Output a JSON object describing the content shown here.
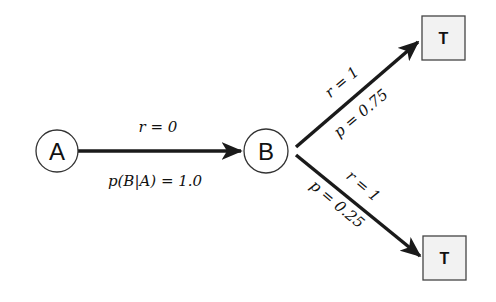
{
  "diagram": {
    "type": "markov-decision-diagram",
    "nodes": [
      {
        "id": "A",
        "label": "A",
        "shape": "circle"
      },
      {
        "id": "B",
        "label": "B",
        "shape": "circle"
      },
      {
        "id": "T1",
        "label": "T",
        "shape": "square"
      },
      {
        "id": "T2",
        "label": "T",
        "shape": "square"
      }
    ],
    "edges": [
      {
        "from": "A",
        "to": "B",
        "label_top": "r = 0",
        "label_bottom": "p(B|A) = 1.0"
      },
      {
        "from": "B",
        "to": "T1",
        "label_top": "r = 1",
        "label_bottom": "p = 0.75"
      },
      {
        "from": "B",
        "to": "T2",
        "label_top": "r = 1",
        "label_bottom": "p = 0.25"
      }
    ]
  },
  "colors": {
    "edge": "#1a1a1a",
    "node_stroke": "#333333",
    "terminal_fill": "#f2f2f2",
    "text": "#111111"
  }
}
